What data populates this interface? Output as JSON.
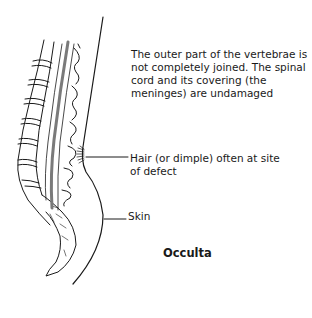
{
  "diagram": {
    "title": "Occulta",
    "labels": {
      "description": "The outer part of the vertebrae is not completely joined. The spinal cord and its covering (the meninges) are undamaged",
      "hair": "Hair (or dimple) often at site of defect",
      "skin": "Skin"
    },
    "colors": {
      "line": "#1a1a1a",
      "spinal_cord": "#7a7a7a",
      "background": "#ffffff"
    }
  }
}
